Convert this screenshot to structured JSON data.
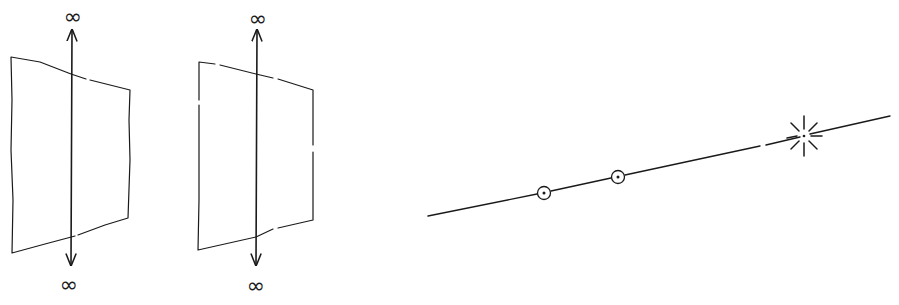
{
  "figure": {
    "panels": [
      {
        "id": "plane-1",
        "top_label": "∞",
        "bottom_label": "∞"
      },
      {
        "id": "plane-2",
        "top_label": "∞",
        "bottom_label": "∞"
      }
    ],
    "line": {
      "points": [
        {
          "id": "point-1",
          "type": "circled-dot"
        },
        {
          "id": "point-2",
          "type": "circled-dot"
        }
      ],
      "star": {
        "id": "point-at-infinity",
        "type": "starburst"
      }
    },
    "colors": {
      "ink": "#1a1a1a",
      "background": "#ffffff"
    }
  }
}
